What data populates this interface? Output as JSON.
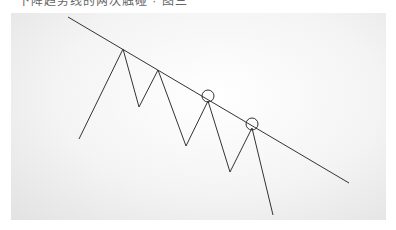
{
  "caption": "下降趋势线的两次触碰 · 图三",
  "diagram": {
    "type": "descending-trendline-zigzag",
    "trendline": {
      "x1": 68,
      "y1": 17,
      "x2": 349,
      "y2": 183
    },
    "zigzag_points": [
      [
        79,
        139
      ],
      [
        123,
        49
      ],
      [
        139,
        107
      ],
      [
        158,
        70
      ],
      [
        186,
        146
      ],
      [
        208,
        101
      ],
      [
        230,
        172
      ],
      [
        252,
        128
      ],
      [
        273,
        215
      ]
    ],
    "touch_circles": [
      {
        "cx": 208,
        "cy": 96,
        "r": 6
      },
      {
        "cx": 252,
        "cy": 124,
        "r": 6
      }
    ],
    "line_color": "#333333"
  }
}
